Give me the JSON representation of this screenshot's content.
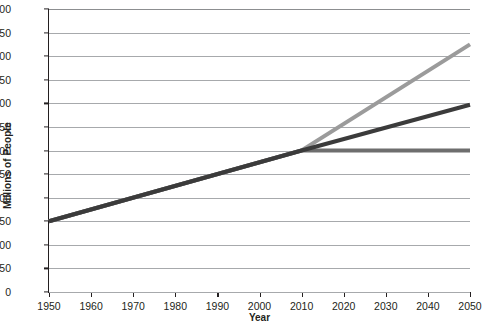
{
  "chart_data": {
    "type": "line",
    "title": "",
    "xlabel": "Year",
    "ylabel": "Millions of People",
    "xlim": [
      1950,
      2050
    ],
    "ylim": [
      0,
      600
    ],
    "grid": true,
    "legend": "none",
    "x_ticks": [
      "1950",
      "1960",
      "1970",
      "1980",
      "1990",
      "2000",
      "2010",
      "2020",
      "2030",
      "2040",
      "2050"
    ],
    "y_ticks": [
      "0",
      "50",
      "100",
      "150",
      "200",
      "250",
      "300",
      "350",
      "400",
      "450",
      "500",
      "550",
      "600"
    ],
    "series": [
      {
        "name": "High projection",
        "color": "#9b9b9b",
        "x": [
          1950,
          2010,
          2050
        ],
        "values": [
          150,
          300,
          525
        ]
      },
      {
        "name": "Medium projection",
        "color": "#3b3b3b",
        "x": [
          1950,
          2010,
          2050
        ],
        "values": [
          150,
          300,
          397
        ]
      },
      {
        "name": "Low projection",
        "color": "#6e6e6e",
        "x": [
          1950,
          2010,
          2050
        ],
        "values": [
          150,
          300,
          300
        ]
      }
    ]
  }
}
